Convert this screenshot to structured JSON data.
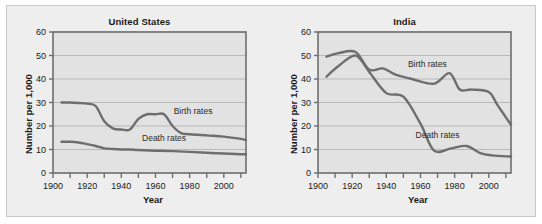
{
  "figure": {
    "background_color": "#ffffff",
    "panel_background_color": "#eeeeee",
    "plot_background_color": "#e2e2e2",
    "frame_color": "#6f6f6f",
    "grid_color": "#b9b9b9",
    "line_color": "#6e6e6e"
  },
  "chart_data": [
    {
      "type": "line",
      "title": "United States",
      "xlabel": "Year",
      "ylabel": "Number per 1,000",
      "xlim": [
        1900,
        2013
      ],
      "ylim": [
        0,
        60
      ],
      "yticks": [
        0,
        10,
        20,
        30,
        40,
        50,
        60
      ],
      "ytick_labels": [
        "0",
        "10",
        "20",
        "30",
        "40",
        "50",
        "60"
      ],
      "xticks": [
        1900,
        1910,
        1920,
        1930,
        1940,
        1950,
        1960,
        1970,
        1980,
        1990,
        2000,
        2010
      ],
      "xtick_labels": [
        "1900",
        "",
        "1920",
        "",
        "1940",
        "",
        "1960",
        "",
        "1980",
        "",
        "2000",
        ""
      ],
      "grid": true,
      "grid_axis": "y",
      "legend_position": "inline-annotations",
      "series": [
        {
          "name": "Birth rates",
          "label_x": 1982,
          "label_y": 25,
          "x": [
            1905,
            1910,
            1915,
            1920,
            1925,
            1930,
            1935,
            1940,
            1945,
            1950,
            1955,
            1960,
            1965,
            1970,
            1975,
            1980,
            1990,
            2000,
            2010,
            2013
          ],
          "y": [
            30,
            30,
            29.8,
            29.5,
            28.5,
            22,
            19,
            18.5,
            18.5,
            23,
            25,
            25,
            25,
            20,
            17,
            16.5,
            16,
            15.5,
            14.5,
            14
          ]
        },
        {
          "name": "Death rates",
          "label_x": 1965,
          "label_y": 13.5,
          "x": [
            1905,
            1910,
            1915,
            1920,
            1925,
            1930,
            1935,
            1940,
            1945,
            1950,
            1960,
            1970,
            1980,
            1990,
            2000,
            2010,
            2013
          ],
          "y": [
            13.3,
            13.3,
            13,
            12.3,
            11.5,
            10.5,
            10.2,
            10,
            10,
            9.8,
            9.5,
            9.3,
            9,
            8.6,
            8.3,
            8,
            8
          ]
        }
      ]
    },
    {
      "type": "line",
      "title": "India",
      "xlabel": "Year",
      "ylabel": "Number per 1,000",
      "xlim": [
        1900,
        2013
      ],
      "ylim": [
        0,
        60
      ],
      "yticks": [
        0,
        10,
        20,
        30,
        40,
        50,
        60
      ],
      "ytick_labels": [
        "0",
        "10",
        "20",
        "30",
        "40",
        "50",
        "60"
      ],
      "xticks": [
        1900,
        1910,
        1920,
        1930,
        1940,
        1950,
        1960,
        1970,
        1980,
        1990,
        2000,
        2010
      ],
      "xtick_labels": [
        "1900",
        "",
        "1920",
        "",
        "1940",
        "",
        "1960",
        "",
        "1980",
        "",
        "2000",
        ""
      ],
      "grid": true,
      "grid_axis": "y",
      "legend_position": "inline-annotations",
      "series": [
        {
          "name": "Birth rates",
          "label_x": 1964,
          "label_y": 45,
          "x": [
            1905,
            1912,
            1922,
            1930,
            1938,
            1945,
            1955,
            1968,
            1977,
            1983,
            1990,
            2000,
            2005,
            2013
          ],
          "y": [
            49.5,
            51,
            51.5,
            44,
            44.5,
            42,
            40,
            38,
            42.5,
            35.5,
            35.5,
            34.5,
            29,
            20.5
          ]
        },
        {
          "name": "Death rates",
          "label_x": 1970,
          "label_y": 15,
          "x": [
            1905,
            1912,
            1922,
            1930,
            1940,
            1950,
            1960,
            1968,
            1978,
            1987,
            1995,
            2002,
            2013
          ],
          "y": [
            41,
            45.5,
            50,
            43,
            34,
            32.5,
            21,
            9.5,
            10.5,
            11.5,
            8.5,
            7.5,
            7
          ]
        }
      ]
    }
  ]
}
